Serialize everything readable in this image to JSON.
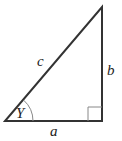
{
  "diagram": {
    "type": "right-triangle",
    "labels": {
      "hypotenuse": "c",
      "vertical_leg": "b",
      "horizontal_leg": "a",
      "angle": "Y"
    },
    "colors": {
      "stroke": "#333333",
      "right_angle_marker": "#888888",
      "angle_arc": "#888888"
    }
  }
}
